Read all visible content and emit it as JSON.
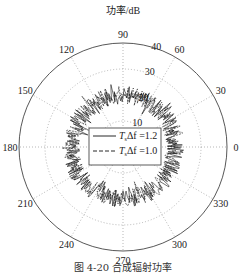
{
  "chart_data": {
    "type": "polar-line",
    "title": "功率/dB",
    "radial_ticks": [
      "10",
      "20",
      "30",
      "40"
    ],
    "radial_range": [
      0,
      40
    ],
    "angle_ticks": [
      "0",
      "30",
      "60",
      "90",
      "120",
      "150",
      "180",
      "210",
      "240",
      "270",
      "300",
      "330"
    ],
    "grid": true,
    "legend_position": "center",
    "series": [
      {
        "name": "T_sΔf = 1.2",
        "style": "solid",
        "approx_radius_db": 20,
        "fluctuation_db": [
          17,
          24
        ]
      },
      {
        "name": "T_sΔf = 1.0",
        "style": "dashed",
        "approx_radius_db": 20,
        "fluctuation_db": [
          17,
          24
        ]
      }
    ]
  },
  "legend": {
    "items": [
      {
        "label": "T",
        "sub": "s",
        "rest": "Δf =1.2"
      },
      {
        "label": "T",
        "sub": "s",
        "rest": "Δf =1.0"
      }
    ]
  },
  "caption": "图 4-20  合成辐射功率"
}
